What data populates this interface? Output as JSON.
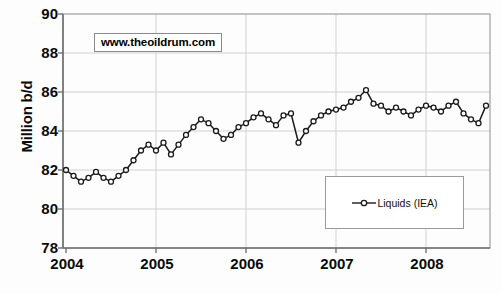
{
  "chart_data": {
    "type": "line",
    "title": "",
    "xlabel": "",
    "ylabel": "Million b/d",
    "ylim": [
      78,
      90
    ],
    "ytick_labels": [
      "90",
      "88",
      "86",
      "84",
      "82",
      "80",
      "78"
    ],
    "ytick_values": [
      90,
      88,
      86,
      84,
      82,
      80,
      78
    ],
    "xtick_labels": [
      "2004",
      "2005",
      "2006",
      "2007",
      "2008"
    ],
    "xtick_values": [
      2004,
      2005,
      2006,
      2007,
      2008
    ],
    "grid": true,
    "legend_position": "lower right",
    "legend": [
      "Liquids (IEA)"
    ],
    "series": [
      {
        "name": "Liquids (IEA)",
        "marker": "open-circle",
        "color": "#1a1a1a",
        "x_start": "2004-01",
        "x_step_months": 1,
        "values": [
          82.0,
          81.7,
          81.4,
          81.6,
          81.9,
          81.6,
          81.4,
          81.7,
          82.0,
          82.5,
          83.0,
          83.3,
          83.0,
          83.4,
          82.8,
          83.3,
          83.8,
          84.2,
          84.6,
          84.4,
          84.0,
          83.6,
          83.8,
          84.2,
          84.4,
          84.7,
          84.9,
          84.6,
          84.3,
          84.8,
          84.9,
          83.4,
          84.0,
          84.5,
          84.8,
          85.0,
          85.1,
          85.2,
          85.5,
          85.7,
          86.1,
          85.4,
          85.3,
          85.0,
          85.2,
          85.0,
          84.8,
          85.1,
          85.3,
          85.2,
          85.0,
          85.3,
          85.5,
          84.9,
          84.6,
          84.4,
          85.3,
          84.6,
          84.8,
          85.4,
          86.1,
          85.9,
          86.0,
          86.1,
          86.7,
          86.8,
          86.4,
          86.2,
          86.3,
          86.5,
          86.8,
          87.0,
          87.8,
          86.2,
          84.9,
          86.3,
          86.4
        ]
      }
    ]
  },
  "axes": {
    "y_title": "Million b/d"
  },
  "annotations": {
    "watermark": "www.theoildrum.com"
  }
}
